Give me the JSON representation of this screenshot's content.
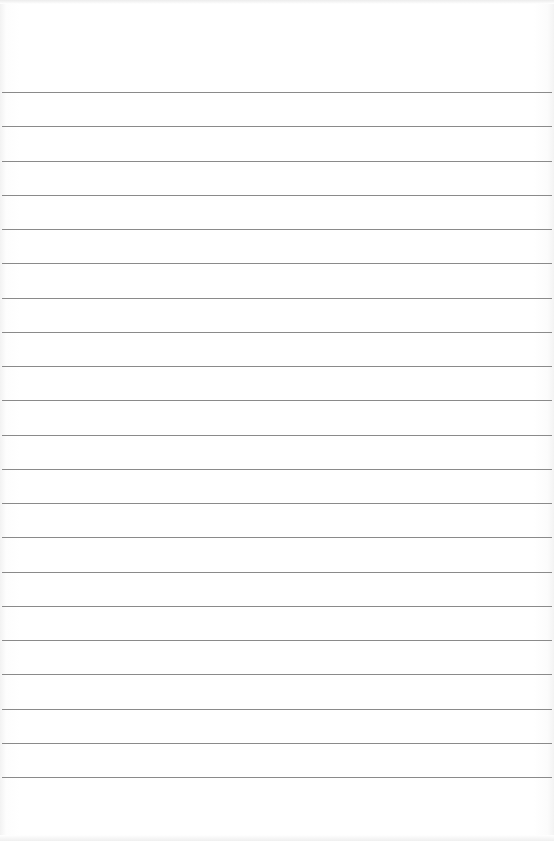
{
  "paper": {
    "type": "lined-paper",
    "background_color": "#ffffff",
    "line_color": "#8a8a8a",
    "line_count": 21,
    "first_line_y": 92,
    "line_spacing": 34.25
  }
}
